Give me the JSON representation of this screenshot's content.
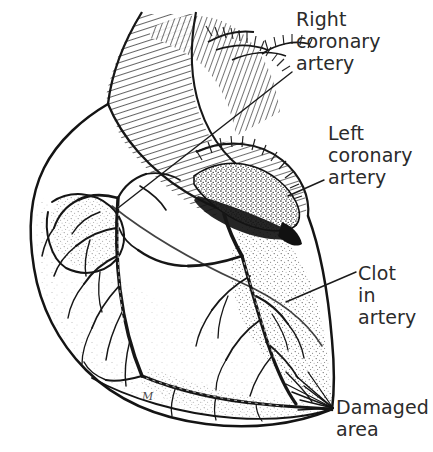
{
  "figure": {
    "background_color": "#ffffff",
    "ink_color": "#1a1a1a",
    "label_color": "#2b2b2b",
    "width": 433,
    "height": 452
  },
  "labels": {
    "right_coronary_artery": "Right\ncoronary\nartery",
    "left_coronary_artery": "Left\ncoronary\nartery",
    "clot_in_artery": "Clot\nin\nartery",
    "damaged_area": "Damaged\narea"
  },
  "annotations": {
    "artist_monogram": "M"
  },
  "structures": [
    {
      "name": "aorta",
      "description": "ascending aorta and aortic arch with cross-hatched shading"
    },
    {
      "name": "brachiocephalic-vessels",
      "description": "great vessels branching from the aortic arch"
    },
    {
      "name": "pulmonary-artery",
      "description": "pulmonary trunk crossing the anterior heart"
    },
    {
      "name": "right-atrial-appendage",
      "description": "stippled right atrial appendage at upper left"
    },
    {
      "name": "right-ventricle",
      "description": "anterior right ventricle body"
    },
    {
      "name": "left-ventricle",
      "description": "left ventricle, lower right, stippled damaged region"
    },
    {
      "name": "right-coronary-artery",
      "description": "coronary artery tree on the left side of the figure"
    },
    {
      "name": "left-coronary-artery",
      "description": "coronary artery emerging beneath the dark occluded segment"
    },
    {
      "name": "clot",
      "description": "dark stippled thrombus occluding the left coronary artery"
    },
    {
      "name": "damaged-area",
      "description": "stippled infarcted myocardium at the lower right apex"
    }
  ]
}
